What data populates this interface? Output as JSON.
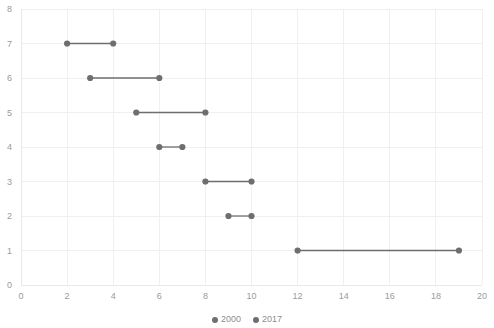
{
  "chart_data": {
    "type": "scatter",
    "subtype": "dumbbell",
    "title": "",
    "xlabel": "",
    "ylabel": "",
    "xlim": [
      0,
      20
    ],
    "ylim": [
      0,
      8
    ],
    "x_ticks": [
      0,
      2,
      4,
      6,
      8,
      10,
      12,
      14,
      16,
      18,
      20
    ],
    "y_ticks": [
      0,
      1,
      2,
      3,
      4,
      5,
      6,
      7,
      8
    ],
    "grid": true,
    "legend_position": "bottom",
    "categories": [
      7,
      6,
      5,
      4,
      3,
      2,
      1
    ],
    "series": [
      {
        "name": "2000",
        "values": [
          2,
          3,
          5,
          6,
          8,
          9,
          12
        ]
      },
      {
        "name": "2017",
        "values": [
          4,
          6,
          8,
          7,
          10,
          10,
          19
        ]
      }
    ],
    "rows": [
      {
        "y": 7,
        "start": 2,
        "end": 4
      },
      {
        "y": 6,
        "start": 3,
        "end": 6
      },
      {
        "y": 5,
        "start": 5,
        "end": 8
      },
      {
        "y": 4,
        "start": 6,
        "end": 7
      },
      {
        "y": 3,
        "start": 8,
        "end": 10
      },
      {
        "y": 2,
        "start": 9,
        "end": 10
      },
      {
        "y": 1,
        "start": 12,
        "end": 19
      }
    ],
    "colors": {
      "marker": "#6e6e72",
      "connector": "#6e6e72",
      "grid": "#f0f0f3",
      "axis": "#e8e8ec",
      "tick_text": "#9a9a9e"
    }
  },
  "legend": {
    "items": [
      {
        "label": "2000",
        "color": "#6e6e72"
      },
      {
        "label": "2017",
        "color": "#6e6e72"
      }
    ]
  },
  "x_tick_labels": [
    "0",
    "2",
    "4",
    "6",
    "8",
    "10",
    "12",
    "14",
    "16",
    "18",
    "20"
  ],
  "y_tick_labels": [
    "0",
    "1",
    "2",
    "3",
    "4",
    "5",
    "6",
    "7",
    "8"
  ]
}
